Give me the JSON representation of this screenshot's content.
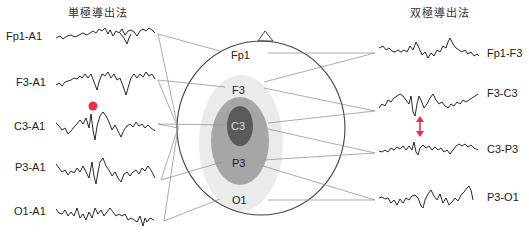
{
  "titles": {
    "left": "単極導出法",
    "right": "双極導出法"
  },
  "electrodes": {
    "fp1": "Fp1",
    "f3": "F3",
    "c3": "C3",
    "p3": "P3",
    "o1": "O1"
  },
  "monopolar": [
    {
      "label": "Fp1-A1"
    },
    {
      "label": "F3-A1"
    },
    {
      "label": "C3-A1"
    },
    {
      "label": "P3-A1"
    },
    {
      "label": "O1-A1"
    }
  ],
  "bipolar": [
    {
      "label": "Fp1-F3"
    },
    {
      "label": "F3-C3"
    },
    {
      "label": "C3-P3"
    },
    {
      "label": "P3-O1"
    }
  ],
  "colors": {
    "trace": "#111111",
    "line": "#888888",
    "head": "#444444",
    "zone_outer": "#ebebeb",
    "zone_mid": "#a6a6a6",
    "zone_core": "#5a5a5a",
    "marker": "#e8304a"
  },
  "annotations": {
    "spike_marker": "red-dot",
    "phase_reversal_marker": "red-double-arrow"
  }
}
